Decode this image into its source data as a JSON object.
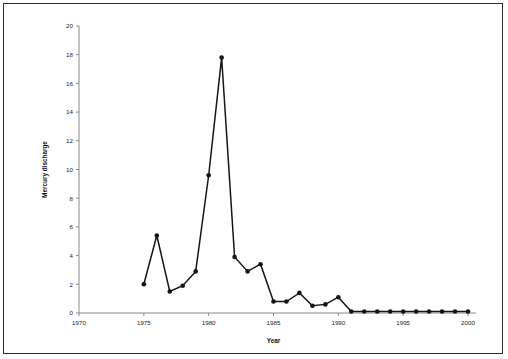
{
  "chart_data": {
    "type": "line",
    "title": "",
    "xlabel": "Year",
    "ylabel": "Mercury discharge",
    "xlim": [
      1970,
      2000
    ],
    "ylim": [
      0,
      20
    ],
    "xticks": [
      1970,
      1975,
      1980,
      1985,
      1990,
      1995,
      2000
    ],
    "yticks": [
      0,
      2,
      4,
      6,
      8,
      10,
      12,
      14,
      16,
      18,
      20
    ],
    "grid": false,
    "legend": null,
    "x": [
      1975,
      1976,
      1977,
      1978,
      1979,
      1980,
      1981,
      1982,
      1983,
      1984,
      1985,
      1986,
      1987,
      1988,
      1989,
      1990,
      1991,
      1992,
      1993,
      1994,
      1995,
      1996,
      1997,
      1998,
      1999,
      2000
    ],
    "values": [
      2.0,
      5.4,
      1.5,
      1.9,
      2.9,
      9.6,
      17.8,
      3.9,
      2.9,
      3.4,
      0.8,
      0.8,
      1.4,
      0.5,
      0.6,
      1.1,
      0.1,
      0.1,
      0.1,
      0.1,
      0.1,
      0.1,
      0.1,
      0.1,
      0.1,
      0.1
    ],
    "series": [
      {
        "name": "Mercury discharge",
        "marker": "circle",
        "color": "#141414",
        "values": [
          2.0,
          5.4,
          1.5,
          1.9,
          2.9,
          9.6,
          17.8,
          3.9,
          2.9,
          3.4,
          0.8,
          0.8,
          1.4,
          0.5,
          0.6,
          1.1,
          0.1,
          0.1,
          0.1,
          0.1,
          0.1,
          0.1,
          0.1,
          0.1,
          0.1,
          0.1
        ]
      }
    ],
    "axis_color": "#8a8a8a",
    "frame_color": "#2b2b2b"
  },
  "labels": {
    "y_axis_title": "Mercury discharge",
    "x_axis_title": "Year",
    "y_ticks": [
      "0",
      "2",
      "4",
      "6",
      "8",
      "10",
      "12",
      "14",
      "16",
      "18",
      "20"
    ],
    "x_ticks": [
      "1970",
      "1975",
      "1980",
      "1985",
      "1990",
      "1995",
      "2000"
    ]
  }
}
